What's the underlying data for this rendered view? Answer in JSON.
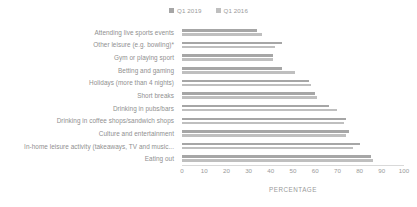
{
  "chart_data": {
    "type": "bar",
    "orientation": "horizontal",
    "title": "",
    "xlabel": "PERCENTAGE",
    "ylabel": "",
    "xlim": [
      0,
      100
    ],
    "xticks": [
      0,
      10,
      20,
      30,
      40,
      50,
      60,
      70,
      80,
      90,
      100
    ],
    "grid": false,
    "legend_position": "top-center",
    "categories": [
      "Attending live sports events",
      "Other leisure (e.g. bowling)*",
      "Gym or playing sport",
      "Betting and gaming",
      "Holidays (more than 4 nights)",
      "Short breaks",
      "Drinking in pubs/bars",
      "Drinking in coffee shops/sandwich shops",
      "Culture and entertainment",
      "In-home leisure activity (takeaways, TV and music...",
      "Eating out"
    ],
    "series": [
      {
        "name": "Q1 2019",
        "color": "#a6a6a6",
        "values": [
          34,
          45,
          41,
          45,
          57,
          60,
          66,
          74,
          75,
          80,
          85
        ]
      },
      {
        "name": "Q1 2016",
        "color": "#bfbfbf",
        "values": [
          36,
          42,
          41,
          51,
          58,
          61,
          70,
          73,
          74,
          77,
          86
        ]
      }
    ]
  },
  "legend": {
    "items": [
      {
        "label": "Q1 2019",
        "color": "#a6a6a6"
      },
      {
        "label": "Q1 2016",
        "color": "#bfbfbf"
      }
    ]
  },
  "axis": {
    "title": "PERCENTAGE",
    "tick_labels": [
      "0",
      "10",
      "20",
      "30",
      "40",
      "50",
      "60",
      "70",
      "80",
      "90",
      "100"
    ]
  }
}
